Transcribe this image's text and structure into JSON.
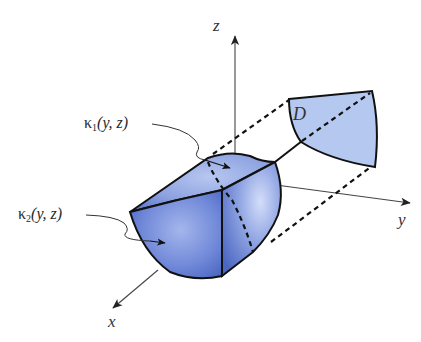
{
  "diagram": {
    "type": "3d-region-projection",
    "axes": {
      "x": {
        "label": "x"
      },
      "y": {
        "label": "y"
      },
      "z": {
        "label": "z"
      }
    },
    "region_label": "D",
    "annotations": [
      {
        "id": "kappa1",
        "symbol": "κ",
        "subscript": "1",
        "args": "(y, z)"
      },
      {
        "id": "kappa2",
        "symbol": "κ",
        "subscript": "2",
        "args": "(y, z)"
      }
    ],
    "colors": {
      "solid_fill": "#6f88d8",
      "solid_light": "#a9bcec",
      "solid_dark": "#3d57b3",
      "region_fill": "#b4c8f0",
      "edge": "#111111",
      "axis": "#444444"
    }
  }
}
